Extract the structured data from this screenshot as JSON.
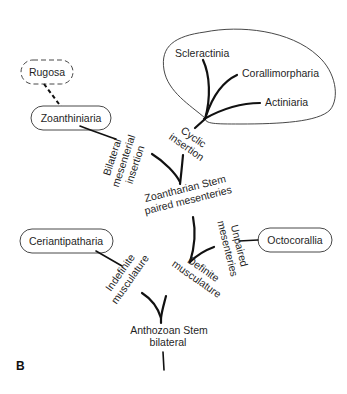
{
  "panel_label": "B",
  "nodes": {
    "rugosa": "Rugosa",
    "zoanthiniaria": "Zoanthiniaria",
    "scleractinia": "Scleractinia",
    "corallimorpharia": "Corallimorpharia",
    "actiniaria": "Actiniaria",
    "ceriantipatharia": "Ceriantipatharia",
    "octocorallia": "Octocorallia"
  },
  "stems": {
    "zoantharian_line1": "Zoantharian Stem",
    "zoantharian_line2": "paired mesenteries",
    "anthozoan_line1": "Anthozoan Stem",
    "anthozoan_line2": "bilateral"
  },
  "branch_labels": {
    "bilateral_line1": "Bilateral",
    "bilateral_line2": "mesenterial",
    "bilateral_line3": "insertion",
    "cyclic_line1": "Cyclic",
    "cyclic_line2": "insertion",
    "unpaired_line1": "Unpaired",
    "unpaired_line2": "mesenteries",
    "indefinite_line1": "Indefinite",
    "indefinite_line2": "musculature",
    "definite_line1": "Definite",
    "definite_line2": "musculature"
  }
}
